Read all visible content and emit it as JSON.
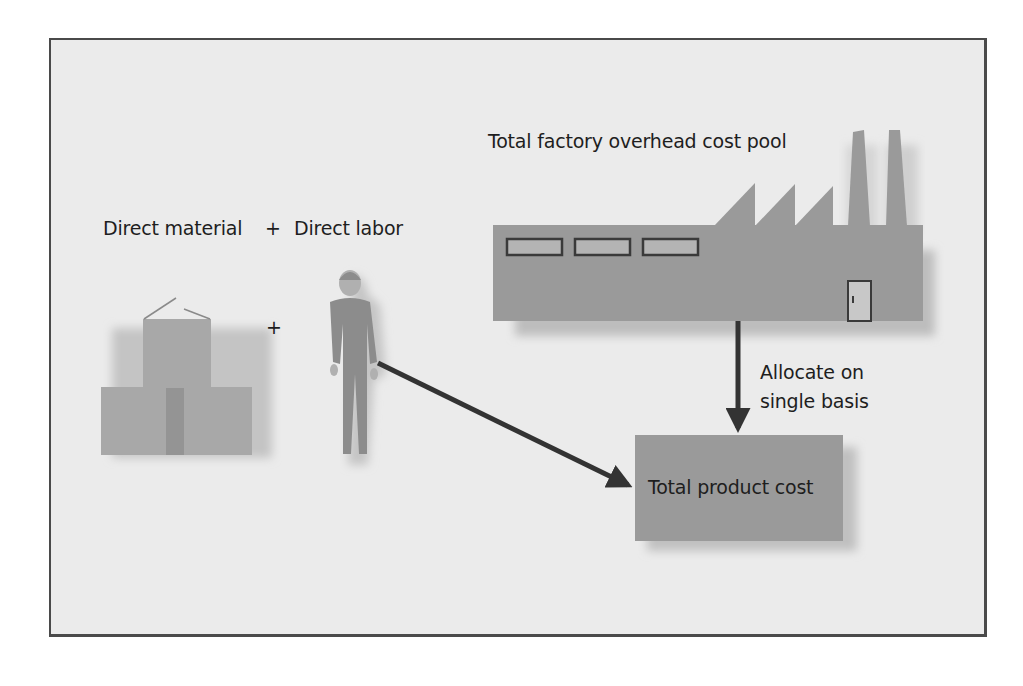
{
  "diagram": {
    "labels": {
      "overhead_pool": "Total factory overhead cost pool",
      "direct_material": "Direct material",
      "plus_header": "+",
      "direct_labor": "Direct labor",
      "plus_between": "+",
      "allocate_line1": "Allocate on",
      "allocate_line2": "single basis",
      "product_cost": "Total product cost"
    },
    "nodes": [
      {
        "id": "direct-material",
        "label": "Direct material",
        "icon": "stacked-boxes-icon"
      },
      {
        "id": "direct-labor",
        "label": "Direct labor",
        "icon": "worker-icon"
      },
      {
        "id": "overhead-pool",
        "label": "Total factory overhead cost pool",
        "icon": "factory-icon"
      },
      {
        "id": "product-cost",
        "label": "Total product cost",
        "icon": "box"
      }
    ],
    "edges": [
      {
        "from": "direct-labor",
        "to": "product-cost",
        "label": ""
      },
      {
        "from": "overhead-pool",
        "to": "product-cost",
        "label": "Allocate on single basis"
      }
    ],
    "colors": {
      "background": "#ebebeb",
      "border": "#4a4a4a",
      "shape_fill": "#9a9a9a",
      "boxes_fill": "#a8a8a8",
      "worker_fill": "#8c8c8c",
      "arrow": "#333333",
      "text": "#1e1e1e"
    }
  }
}
